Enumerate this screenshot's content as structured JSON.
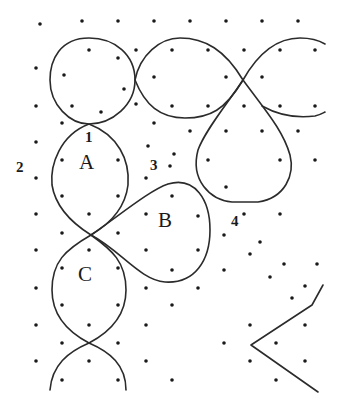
{
  "diagram": {
    "type": "dot-lattice-curves",
    "stroke_color": "#2b2b2b",
    "dot_color": "#1a1a1a",
    "region_labels": [
      {
        "id": "A",
        "text": "A",
        "x": 79,
        "y": 168
      },
      {
        "id": "B",
        "text": "B",
        "x": 158,
        "y": 226
      },
      {
        "id": "C",
        "text": "C",
        "x": 78,
        "y": 280
      }
    ],
    "point_labels": [
      {
        "id": "1",
        "text": "1",
        "x": 85,
        "y": 142
      },
      {
        "id": "2",
        "text": "2",
        "x": 16,
        "y": 172
      },
      {
        "id": "3",
        "text": "3",
        "x": 150,
        "y": 170
      },
      {
        "id": "4",
        "text": "4",
        "x": 231,
        "y": 226
      }
    ],
    "dots": [
      [
        40,
        24
      ],
      [
        82,
        21
      ],
      [
        118,
        21
      ],
      [
        154,
        21
      ],
      [
        190,
        21
      ],
      [
        226,
        21
      ],
      [
        262,
        21
      ],
      [
        298,
        21
      ],
      [
        36,
        68
      ],
      [
        89,
        50
      ],
      [
        118,
        58
      ],
      [
        136,
        50
      ],
      [
        172,
        50
      ],
      [
        208,
        50
      ],
      [
        244,
        50
      ],
      [
        280,
        50
      ],
      [
        315,
        50
      ],
      [
        64,
        75
      ],
      [
        124,
        89
      ],
      [
        154,
        77
      ],
      [
        226,
        77
      ],
      [
        262,
        77
      ],
      [
        36,
        106
      ],
      [
        72,
        106
      ],
      [
        101,
        112
      ],
      [
        136,
        104
      ],
      [
        172,
        106
      ],
      [
        208,
        106
      ],
      [
        244,
        106
      ],
      [
        280,
        106
      ],
      [
        315,
        106
      ],
      [
        62,
        123
      ],
      [
        154,
        123
      ],
      [
        190,
        131
      ],
      [
        226,
        131
      ],
      [
        262,
        131
      ],
      [
        298,
        131
      ],
      [
        36,
        142
      ],
      [
        148,
        146
      ],
      [
        174,
        154
      ],
      [
        62,
        160
      ],
      [
        118,
        160
      ],
      [
        170,
        166
      ],
      [
        208,
        160
      ],
      [
        280,
        160
      ],
      [
        315,
        160
      ],
      [
        36,
        178
      ],
      [
        146,
        178
      ],
      [
        62,
        196
      ],
      [
        118,
        196
      ],
      [
        172,
        196
      ],
      [
        226,
        187
      ],
      [
        36,
        214
      ],
      [
        89,
        214
      ],
      [
        146,
        214
      ],
      [
        198,
        216
      ],
      [
        244,
        214
      ],
      [
        280,
        214
      ],
      [
        62,
        233
      ],
      [
        118,
        233
      ],
      [
        224,
        235
      ],
      [
        260,
        242
      ],
      [
        36,
        250
      ],
      [
        89,
        250
      ],
      [
        146,
        250
      ],
      [
        198,
        250
      ],
      [
        250,
        254
      ],
      [
        62,
        268
      ],
      [
        118,
        268
      ],
      [
        172,
        270
      ],
      [
        224,
        270
      ],
      [
        284,
        264
      ],
      [
        317,
        264
      ],
      [
        36,
        288
      ],
      [
        146,
        288
      ],
      [
        198,
        288
      ],
      [
        270,
        277
      ],
      [
        305,
        286
      ],
      [
        62,
        305
      ],
      [
        118,
        305
      ],
      [
        172,
        305
      ],
      [
        292,
        298
      ],
      [
        36,
        325
      ],
      [
        89,
        325
      ],
      [
        146,
        325
      ],
      [
        250,
        325
      ],
      [
        305,
        325
      ],
      [
        62,
        343
      ],
      [
        118,
        343
      ],
      [
        224,
        343
      ],
      [
        276,
        343
      ],
      [
        36,
        361
      ],
      [
        89,
        361
      ],
      [
        146,
        361
      ],
      [
        250,
        361
      ],
      [
        305,
        361
      ],
      [
        62,
        380
      ],
      [
        118,
        380
      ],
      [
        172,
        380
      ],
      [
        276,
        380
      ]
    ],
    "curves": [
      {
        "name": "top-left-circle",
        "d": "M 89 38 C 60 38 50 60 50 80 C 50 105 70 124 89 124 C 112 124 135 105 135 80 C 135 55 115 38 89 38 Z"
      },
      {
        "name": "top-center-loop",
        "d": "M 135 80 C 140 55 160 38 180 38 C 205 38 225 50 243 80 C 225 110 210 118 185 118 C 160 118 145 105 135 80 Z"
      },
      {
        "name": "top-right-arc-upper",
        "d": "M 243 80 C 260 50 280 38 300 38 C 312 38 320 41 325 44"
      },
      {
        "name": "top-right-arc-lower",
        "d": "M 262 106 C 280 116 300 118 315 116 C 320 115 323 113 325 112"
      },
      {
        "name": "teardrop-right",
        "d": "M 243 80 C 230 100 205 130 198 150 C 190 180 210 200 232 202 L 258 202 C 285 198 295 175 290 155 C 283 130 265 110 243 80 Z"
      },
      {
        "name": "loop-A",
        "d": "M 89 124 C 60 135 50 165 52 185 C 56 210 75 225 91 235 C 108 225 125 210 128 185 C 130 160 118 135 89 124 Z"
      },
      {
        "name": "teardrop-B",
        "d": "M 91 235 C 120 215 150 190 168 184 C 195 176 210 200 210 230 C 210 260 195 284 165 282 C 140 280 120 250 91 235 Z"
      },
      {
        "name": "loop-C",
        "d": "M 91 235 C 65 250 52 262 52 290 C 52 315 68 332 89 343 C 110 332 126 315 126 290 C 126 262 112 250 91 235 Z"
      },
      {
        "name": "bottom-arcs",
        "d": "M 50 390 C 52 365 68 352 89 343 C 110 352 126 365 126 390"
      },
      {
        "name": "chevron",
        "d": "M 323 285 L 312 305 L 251 345 L 318 392"
      }
    ]
  }
}
